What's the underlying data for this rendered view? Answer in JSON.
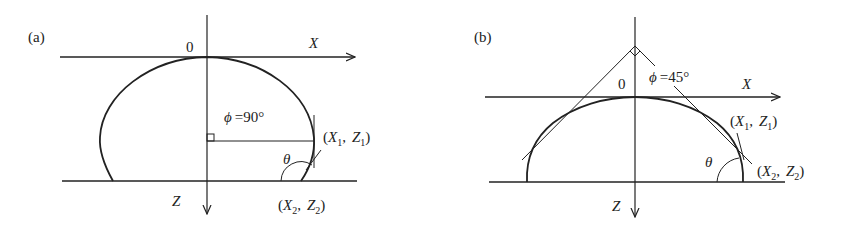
{
  "panels": [
    {
      "id": "a",
      "label": "(a)",
      "origin_label": "0",
      "x_axis_label": "X",
      "z_axis_label": "Z",
      "angle_phi_label": "ϕ = 90°",
      "phi": "ϕ",
      "phi_value": "=90°",
      "contact_angle_label": "θ",
      "point1": {
        "open": "(",
        "x": "X",
        "x_sub": "1",
        "sep": ",",
        "z": "Z",
        "z_sub": "1",
        "close": ")"
      },
      "point2": {
        "open": "(",
        "x": "X",
        "x_sub": "2",
        "sep": ",",
        "z": "Z",
        "z_sub": "2",
        "close": ")"
      },
      "shape": "droplet with contact angle > 90°"
    },
    {
      "id": "b",
      "label": "(b)",
      "origin_label": "0",
      "x_axis_label": "X",
      "z_axis_label": "Z",
      "phi": "ϕ",
      "phi_value": "=45°",
      "contact_angle_label": "θ",
      "point1": {
        "open": "(",
        "x": "X",
        "x_sub": "1",
        "sep": ",",
        "z": "Z",
        "z_sub": "1",
        "close": ")"
      },
      "point2": {
        "open": "(",
        "x": "X",
        "x_sub": "2",
        "sep": ",",
        "z": "Z",
        "z_sub": "2",
        "close": ")"
      },
      "shape": "droplet with contact angle < 90°"
    }
  ],
  "colors": {
    "line": "#222222",
    "background": "#ffffff"
  }
}
